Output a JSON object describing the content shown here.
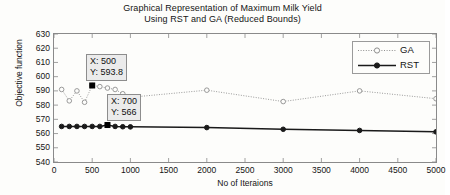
{
  "figure": {
    "title_line1": "Graphical Representation of Maximum Milk Yield",
    "title_line2": "Using RST and GA (Reduced Bounds)"
  },
  "axes": {
    "xlabel": "No of Iteraions",
    "ylabel": "Objective function",
    "xticks": [
      "0",
      "500",
      "1000",
      "1500",
      "2000",
      "2500",
      "3000",
      "3500",
      "4000",
      "4500",
      "5000"
    ],
    "yticks": [
      "630",
      "620",
      "610",
      "600",
      "590",
      "580",
      "570",
      "560",
      "550",
      "540"
    ]
  },
  "legend": {
    "entries": [
      {
        "label": "GA",
        "style": "dotted",
        "marker": "open-circle",
        "color": "#8f8f8f"
      },
      {
        "label": "RST",
        "style": "solid",
        "marker": "filled-circle",
        "color": "#1a1a1a"
      }
    ]
  },
  "datatips": [
    {
      "x_label": "X: 500",
      "y_label": "Y: 593.8",
      "series": "GA",
      "x": 500,
      "y": 593.8
    },
    {
      "x_label": "X: 700",
      "y_label": "Y: 566",
      "series": "RST",
      "x": 700,
      "y": 566
    }
  ],
  "chart_data": {
    "type": "line",
    "title": "Graphical Representation of Maximum Milk Yield Using RST and GA (Reduced Bounds)",
    "xlabel": "No of Iteraions",
    "ylabel": "Objective function",
    "xlim": [
      0,
      5000
    ],
    "ylim": [
      540,
      630
    ],
    "xtick_step": 500,
    "ytick_step": 10,
    "grid": false,
    "legend_position": "top-right",
    "series": [
      {
        "name": "GA",
        "color": "#8f8f8f",
        "linestyle": "dotted",
        "marker": "open-circle",
        "x": [
          100,
          200,
          300,
          400,
          500,
          600,
          700,
          800,
          900,
          1000,
          2000,
          3000,
          4000,
          5000
        ],
        "values": [
          591,
          583,
          590,
          582,
          593.8,
          593,
          592,
          591,
          588,
          585.5,
          590.5,
          582.5,
          590,
          584.5
        ]
      },
      {
        "name": "RST",
        "color": "#1a1a1a",
        "linestyle": "solid",
        "marker": "filled-circle",
        "x": [
          100,
          200,
          300,
          400,
          500,
          600,
          700,
          800,
          900,
          1000,
          2000,
          3000,
          4000,
          5000
        ],
        "values": [
          565,
          565,
          565,
          565,
          565,
          565,
          566,
          565,
          564.8,
          564.7,
          564.2,
          563,
          562.2,
          561.2
        ]
      }
    ],
    "annotations": [
      {
        "text": "X: 500 / Y: 593.8",
        "series": "GA",
        "x": 500,
        "y": 593.8
      },
      {
        "text": "X: 700 / Y: 566",
        "series": "RST",
        "x": 700,
        "y": 566
      }
    ]
  }
}
